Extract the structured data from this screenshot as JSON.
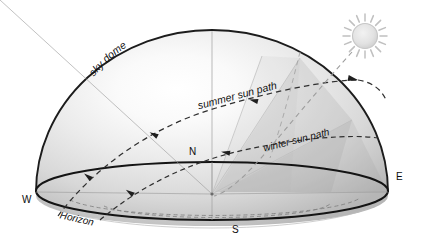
{
  "diagram": {
    "labels": {
      "sky_dome": "sky dome",
      "summer_path": "summer sun path",
      "winter_path": "winter sun path",
      "horizon": "Horizon",
      "north": "N",
      "south": "S",
      "east": "E",
      "west": "W"
    },
    "icons": {
      "sun": "sun-icon"
    },
    "colors": {
      "dome_light": "#fdfdfd",
      "dome_mid": "#e3e3e3",
      "dome_edge": "#b4b4b4",
      "base_fill": "#c8c8c8",
      "outline": "#1a1a1a",
      "dashed": "#3a3a3a",
      "sun_fill": "#e0e0e0",
      "sun_ray": "#bdbdbd",
      "background": "#ffffff"
    },
    "elements": {
      "dome": "hemisphere sky dome",
      "base_ellipse": "horizon circle",
      "sun_ray_line": "dashed ray from sun to dome",
      "arrow_direction": "westward"
    }
  }
}
